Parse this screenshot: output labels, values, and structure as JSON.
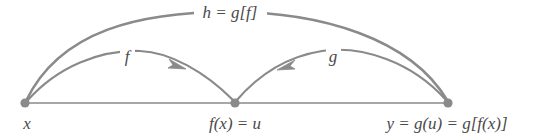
{
  "diagram": {
    "background_color": "#ffffff",
    "stroke_color": "#8a8a8a",
    "text_color": "#4a4a4a",
    "nodes": [
      {
        "id": "x",
        "label": "x",
        "x": 25,
        "y": 103,
        "label_x": 27,
        "label_y": 129,
        "anchor": "middle"
      },
      {
        "id": "u",
        "label": "f(x) = u",
        "x": 235,
        "y": 103,
        "label_x": 235,
        "label_y": 129,
        "anchor": "middle"
      },
      {
        "id": "y",
        "label": "y = g(u) = g[f(x)]",
        "x": 448,
        "y": 103,
        "label_x": 447,
        "label_y": 129,
        "anchor": "middle"
      }
    ],
    "arcs": [
      {
        "id": "h",
        "label": "h = g[f]",
        "label_x": 230,
        "label_y": 18,
        "from": "x",
        "to": "y",
        "via": "top"
      },
      {
        "id": "f",
        "label": "f",
        "label_x": 127,
        "label_y": 62,
        "from": "x",
        "to": "u",
        "arrowhead": true
      },
      {
        "id": "g",
        "label": "g",
        "label_x": 333,
        "label_y": 62,
        "from": "u",
        "to": "y",
        "arrowhead": true
      }
    ],
    "baseline": {
      "x1": 25,
      "y1": 103,
      "x2": 448,
      "y2": 103
    },
    "icons": {
      "node_dot": "filled-circle-node",
      "arrow_f": "arrowhead-right",
      "arrow_g": "arrowhead-right"
    }
  }
}
